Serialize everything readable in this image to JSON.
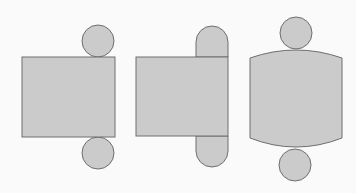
{
  "diagram": {
    "title": "",
    "colors": {
      "background": "#fafafa",
      "fill": "#cbcbcb",
      "stroke": "#6e6e6e"
    },
    "figures": [
      {
        "id": "net-a",
        "label": "",
        "parts": [
          "rectangle",
          "top-circle",
          "bottom-circle"
        ]
      },
      {
        "id": "net-b",
        "label": "",
        "parts": [
          "rectangle",
          "top-rounded-tab",
          "bottom-rounded-tab"
        ]
      },
      {
        "id": "net-c",
        "label": "",
        "parts": [
          "curved-rectangle",
          "top-circle",
          "bottom-circle"
        ]
      }
    ]
  }
}
